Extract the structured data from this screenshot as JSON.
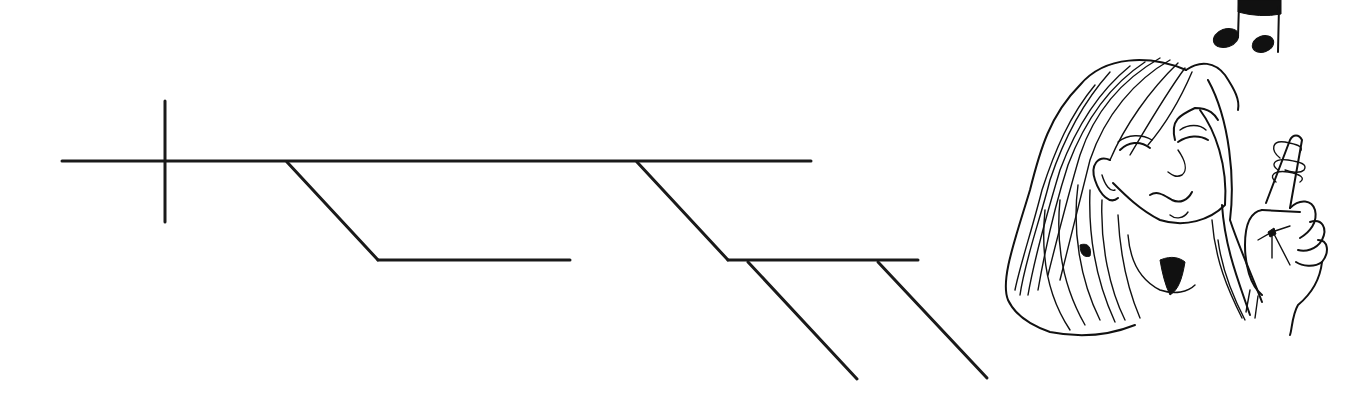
{
  "diagram": {
    "type": "reed-kellogg-sentence-diagram",
    "line_color": "#1a1a1a",
    "background": "#ffffff",
    "segments": [
      {
        "id": "baseline",
        "role": "main-clause-baseline",
        "x1": 62,
        "y1": 161,
        "x2": 811,
        "y2": 161
      },
      {
        "id": "subject-predicate-divider",
        "role": "subject-predicate-divider",
        "x1": 165,
        "y1": 101,
        "x2": 165,
        "y2": 222
      },
      {
        "id": "modifier-1-slant",
        "role": "modifier-slant",
        "x1": 287,
        "y1": 162,
        "x2": 378,
        "y2": 260
      },
      {
        "id": "modifier-1-base",
        "role": "modifier-base",
        "x1": 378,
        "y1": 260,
        "x2": 570,
        "y2": 260
      },
      {
        "id": "phrase-slant",
        "role": "prepositional-phrase-slant",
        "x1": 637,
        "y1": 162,
        "x2": 728,
        "y2": 260
      },
      {
        "id": "phrase-base",
        "role": "prepositional-phrase-object-base",
        "x1": 728,
        "y1": 260,
        "x2": 918,
        "y2": 260
      },
      {
        "id": "phrase-modifier-1",
        "role": "object-modifier-slant",
        "x1": 748,
        "y1": 262,
        "x2": 857,
        "y2": 379
      },
      {
        "id": "phrase-modifier-2",
        "role": "object-modifier-slant",
        "x1": 878,
        "y1": 262,
        "x2": 987,
        "y2": 378
      }
    ]
  },
  "illustration": {
    "subject": "woman-with-string-tied-on-finger",
    "elements": [
      "music-notes-icon",
      "woman-head",
      "hand-with-reminder-string"
    ],
    "ink_color": "#111111"
  }
}
